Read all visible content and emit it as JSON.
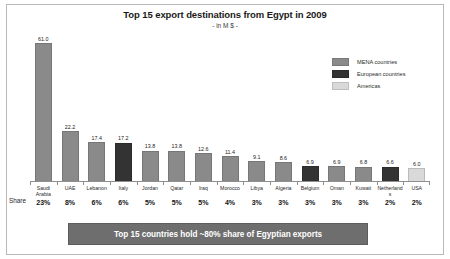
{
  "chart_data": {
    "type": "bar",
    "title": "Top 15 export destinations from Egypt in 2009",
    "subtitle": "- in M $ -",
    "xlabel": "",
    "ylabel": "",
    "ylim": [
      0,
      61
    ],
    "grid": false,
    "legend_position": "top-right",
    "categories": [
      "Saudi Arabia",
      "UAE",
      "Lebanon",
      "Italy",
      "Jordan",
      "Qatar",
      "Iraq",
      "Morocco",
      "Libya",
      "Algeria",
      "Belgium",
      "Oman",
      "Kuwait",
      "Netherlands",
      "USA"
    ],
    "values": [
      61.0,
      22.2,
      17.4,
      17.2,
      13.8,
      13.8,
      12.6,
      11.4,
      9.1,
      8.6,
      6.9,
      6.9,
      6.8,
      6.6,
      6.0
    ],
    "value_labels": [
      "61.0",
      "22.2",
      "17.4",
      "17.2",
      "13.8",
      "13.8",
      "12.6",
      "11.4",
      "9.1",
      "8.6",
      "6.9",
      "6.9",
      "6.8",
      "6.6",
      "6.0"
    ],
    "shares": [
      "23%",
      "8%",
      "6%",
      "6%",
      "5%",
      "5%",
      "5%",
      "4%",
      "3%",
      "3%",
      "3%",
      "3%",
      "3%",
      "2%",
      "2%"
    ],
    "groups": [
      "MENA",
      "MENA",
      "MENA",
      "European",
      "MENA",
      "MENA",
      "MENA",
      "MENA",
      "MENA",
      "MENA",
      "European",
      "MENA",
      "MENA",
      "European",
      "Americas"
    ],
    "series": [
      {
        "name": "Exports",
        "values": [
          61.0,
          22.2,
          17.4,
          17.2,
          13.8,
          13.8,
          12.6,
          11.4,
          9.1,
          8.6,
          6.9,
          6.9,
          6.8,
          6.6,
          6.0
        ]
      }
    ],
    "legend": [
      {
        "label": "MENA countries",
        "color": "#8a8a8a"
      },
      {
        "label": "European countries",
        "color": "#333333"
      },
      {
        "label": "Americas",
        "color": "#d9d9d9"
      }
    ]
  },
  "axis": {
    "share_row_label": "Share"
  },
  "banner": {
    "text": "Top 15 countries hold ~80% share of Egyptian exports",
    "background": "#6e6e6e",
    "text_color": "#ffffff"
  }
}
